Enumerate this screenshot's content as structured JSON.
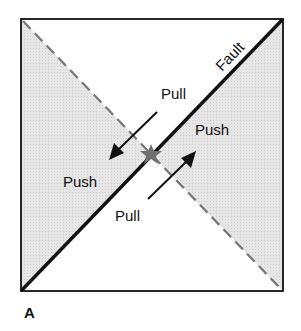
{
  "figure": {
    "panel_label": "A",
    "fault_label": "Fault",
    "labels": {
      "pull_top": "Pull",
      "push_right": "Push",
      "push_left": "Push",
      "pull_bottom": "Pull"
    },
    "icons": {
      "epicenter": "star-icon"
    },
    "colors": {
      "shade": "#e2e2e2",
      "line": "#111111",
      "dashed": "#777777",
      "star": "#707070",
      "background": "#ffffff"
    }
  }
}
